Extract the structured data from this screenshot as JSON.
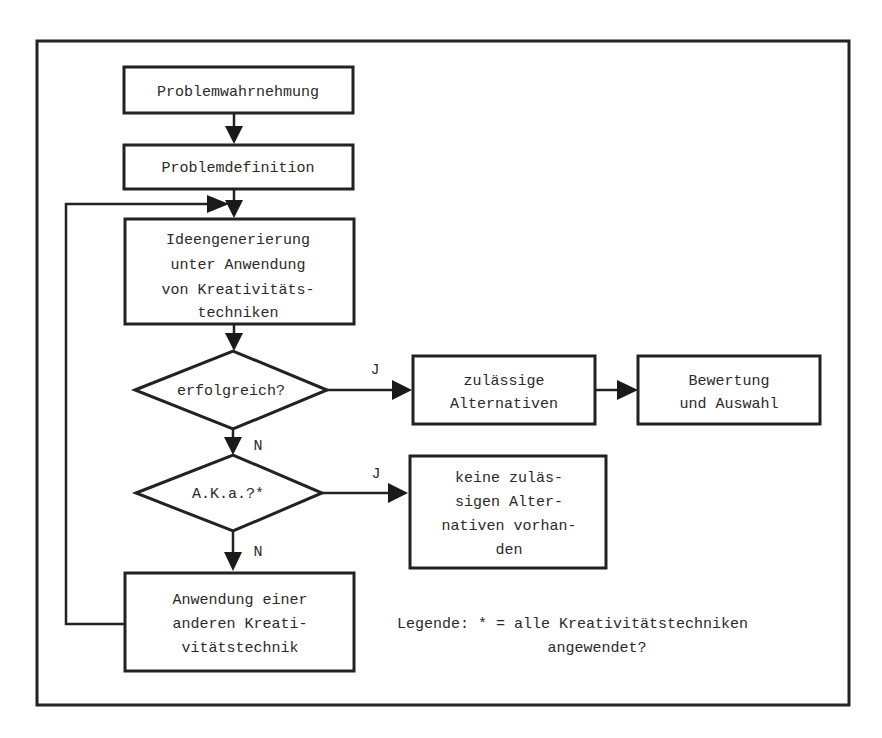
{
  "diagram": {
    "type": "flowchart",
    "language": "de",
    "nodes": {
      "problemwahrnehmung": {
        "lines": [
          "Problemwahrnehmung"
        ]
      },
      "problemdefinition": {
        "lines": [
          "Problemdefinition"
        ]
      },
      "ideengenerierung": {
        "lines": [
          "Ideengenerierung",
          "unter Anwendung",
          "von Kreativitäts-",
          "techniken"
        ]
      },
      "decision_erfolgreich": {
        "lines": [
          "erfolgreich?"
        ]
      },
      "zulaessige_alternativen": {
        "lines": [
          "zulässige",
          "Alternativen"
        ]
      },
      "bewertung": {
        "lines": [
          "Bewertung",
          "und Auswahl"
        ]
      },
      "decision_aka": {
        "lines": [
          "A.K.a.?*"
        ]
      },
      "keine_alternativen": {
        "lines": [
          "keine zuläs-",
          "sigen Alter-",
          "nativen vorhan-",
          "den"
        ]
      },
      "andere_technik": {
        "lines": [
          "Anwendung einer",
          "anderen Kreati-",
          "vitätstechnik"
        ]
      }
    },
    "edge_labels": {
      "yes1": "J",
      "no1": "N",
      "yes2": "J",
      "no2": "N"
    },
    "legend": {
      "line1": "Legende: * = alle Kreativitätstechniken",
      "line2": "angewendet?"
    },
    "colors": {
      "stroke": "#222222",
      "text": "#2a2a2a",
      "background": "#ffffff"
    }
  }
}
